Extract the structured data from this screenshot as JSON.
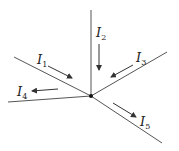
{
  "diagram": {
    "title": "",
    "junction": {
      "x": 91,
      "y": 96
    },
    "labels": {
      "i1": {
        "base": "I",
        "sub": "1"
      },
      "i2": {
        "base": "I",
        "sub": "2"
      },
      "i3": {
        "base": "I",
        "sub": "3"
      },
      "i4": {
        "base": "I",
        "sub": "4"
      },
      "i5": {
        "base": "I",
        "sub": "5"
      }
    },
    "currents": [
      {
        "name": "I1",
        "direction": "into junction"
      },
      {
        "name": "I2",
        "direction": "into junction"
      },
      {
        "name": "I3",
        "direction": "into junction"
      },
      {
        "name": "I4",
        "direction": "out of junction"
      },
      {
        "name": "I5",
        "direction": "out of junction"
      }
    ],
    "colors": {
      "wire": "#555555",
      "arrow": "#333333",
      "node": "#111111"
    }
  }
}
